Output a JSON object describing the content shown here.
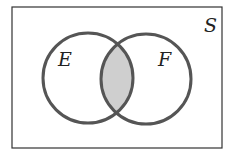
{
  "diagram": {
    "type": "venn",
    "universe_label": "S",
    "sets": [
      {
        "label": "E"
      },
      {
        "label": "F"
      }
    ],
    "shaded_region": "E ∩ F",
    "colors": {
      "outline": "#555555",
      "border": "#333333",
      "shade": "#cfcfcf",
      "background": "#ffffff"
    }
  }
}
